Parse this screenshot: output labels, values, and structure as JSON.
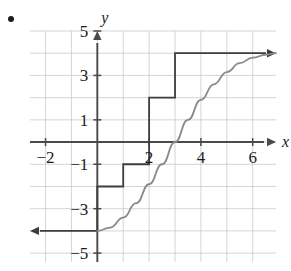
{
  "figure": {
    "bullet_marker": "•",
    "background_color": "#ffffff"
  },
  "chart_data": {
    "type": "line",
    "title": "",
    "subtitle": "",
    "xlabel": "x",
    "ylabel": "y",
    "xlim": [
      -2.6,
      6.9
    ],
    "ylim": [
      -5.4,
      5.0
    ],
    "grid": true,
    "grid_color": "#c9c9c9",
    "grid_spacing": 1,
    "axis_color": "#4a4a4a",
    "legend": null,
    "legend_position": "none",
    "x_ticks": [
      -2,
      2,
      4,
      6
    ],
    "x_tick_labels": [
      "−2",
      "2",
      "4",
      "6"
    ],
    "y_ticks": [
      5,
      3,
      1,
      -1,
      -3,
      -5
    ],
    "y_tick_labels": [
      "5",
      "3",
      "1",
      "−1",
      "−3",
      "−5"
    ],
    "series": [
      {
        "name": "step-function",
        "type": "step",
        "color": "#3d3d3d",
        "arrow_start": true,
        "arrow_end": true,
        "description": "Piecewise constant staircase with a leftward ray at y=-4 and a rightward ray at y=4",
        "segments": [
          {
            "x_start": -2.6,
            "x_end": 0,
            "y": -4
          },
          {
            "x_start": 0,
            "x_end": 1,
            "y": -2
          },
          {
            "x_start": 1,
            "x_end": 2,
            "y": -1
          },
          {
            "x_start": 2,
            "x_end": 3,
            "y": 2
          },
          {
            "x_start": 3,
            "x_end": 6.9,
            "y": 4
          }
        ]
      },
      {
        "name": "smooth-curve",
        "type": "curve",
        "color": "#8a8a8a",
        "description": "Smooth increasing sigmoid from (0,-4) rising through (3,0) and approaching y=4",
        "points": [
          {
            "x": 0.0,
            "y": -4.0
          },
          {
            "x": 0.5,
            "y": -3.85
          },
          {
            "x": 1.0,
            "y": -3.4
          },
          {
            "x": 1.5,
            "y": -2.75
          },
          {
            "x": 2.0,
            "y": -1.9
          },
          {
            "x": 2.5,
            "y": -1.0
          },
          {
            "x": 3.0,
            "y": 0.0
          },
          {
            "x": 3.5,
            "y": 1.0
          },
          {
            "x": 4.0,
            "y": 1.9
          },
          {
            "x": 4.5,
            "y": 2.6
          },
          {
            "x": 5.0,
            "y": 3.15
          },
          {
            "x": 5.5,
            "y": 3.55
          },
          {
            "x": 6.0,
            "y": 3.8
          },
          {
            "x": 6.5,
            "y": 3.93
          },
          {
            "x": 6.9,
            "y": 4.0
          }
        ]
      }
    ]
  }
}
